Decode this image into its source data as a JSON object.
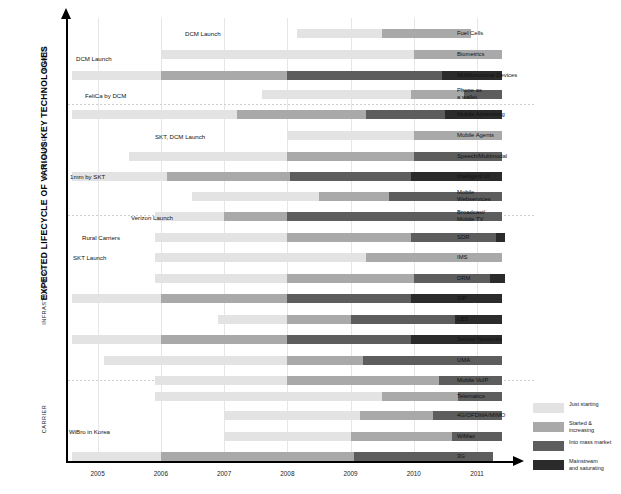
{
  "chart_data": {
    "type": "bar",
    "title": "EXPECTED LIFECYCLE OF VARIOUS KEY TECHNOLOGIES",
    "xlabel": "",
    "ylabel": "",
    "xlim": [
      2004.5,
      2011.6
    ],
    "grid": true,
    "legend_position": "bottom-right",
    "tick_labels": [
      "2005",
      "2006",
      "2007",
      "2008",
      "2009",
      "2010",
      "2011"
    ],
    "tick_values": [
      2005,
      2006,
      2007,
      2008,
      2009,
      2010,
      2011
    ],
    "stage_colors": [
      "#e3e3e3",
      "#a9a9a9",
      "#5d5d5d",
      "#2b2b2b"
    ],
    "legend": [
      {
        "label": "Just starting",
        "color": "#e3e3e3"
      },
      {
        "label": "Started &\nincreasing",
        "color": "#a9a9a9"
      },
      {
        "label": "Into mass market",
        "color": "#5d5d5d"
      },
      {
        "label": "Mainstream\nand saturating",
        "color": "#2b2b2b"
      }
    ],
    "groups": [
      {
        "name": "DEVICES",
        "top": 20,
        "bottom": 104
      },
      {
        "name": "MIDDLEWARE",
        "top": 104,
        "bottom": 215
      },
      {
        "name": "INFRASTRUCTURE",
        "top": 215,
        "bottom": 380
      },
      {
        "name": "CARRIER",
        "top": 380,
        "bottom": 461
      }
    ],
    "group_separators": [
      104,
      215,
      380
    ],
    "series": [
      {
        "name": "Fuel Cells",
        "y": 29,
        "segments": [
          {
            "stage": 0,
            "start": 2008.15,
            "end": 2009.5
          },
          {
            "stage": 1,
            "start": 2009.5,
            "end": 2010.9
          }
        ]
      },
      {
        "name": "Biometrics",
        "y": 50,
        "segments": [
          {
            "stage": 0,
            "start": 2006.0,
            "end": 2010.0
          },
          {
            "stage": 1,
            "start": 2010.0,
            "end": 2011.4
          }
        ]
      },
      {
        "name": "Multifunctional Devices",
        "y": 71,
        "segments": [
          {
            "stage": 0,
            "start": 2004.6,
            "end": 2006.0
          },
          {
            "stage": 1,
            "start": 2006.0,
            "end": 2008.0
          },
          {
            "stage": 2,
            "start": 2008.0,
            "end": 2010.45
          },
          {
            "stage": 3,
            "start": 2010.45,
            "end": 2011.4
          }
        ]
      },
      {
        "name": "Phone as\na wallet",
        "y": 90,
        "segments": [
          {
            "stage": 0,
            "start": 2007.6,
            "end": 2009.95
          },
          {
            "stage": 1,
            "start": 2009.95,
            "end": 2010.8
          },
          {
            "stage": 2,
            "start": 2010.8,
            "end": 2011.4
          }
        ]
      },
      {
        "name": "Mobile Advertising",
        "y": 110,
        "segments": [
          {
            "stage": 0,
            "start": 2004.6,
            "end": 2007.2
          },
          {
            "stage": 1,
            "start": 2007.2,
            "end": 2009.25
          },
          {
            "stage": 2,
            "start": 2009.25,
            "end": 2010.5
          },
          {
            "stage": 3,
            "start": 2010.5,
            "end": 2011.4
          }
        ]
      },
      {
        "name": "Mobile Agents",
        "y": 131,
        "segments": [
          {
            "stage": 0,
            "start": 2008.0,
            "end": 2010.0
          },
          {
            "stage": 1,
            "start": 2010.0,
            "end": 2011.4
          }
        ]
      },
      {
        "name": "Speech/Multimodal",
        "y": 152,
        "segments": [
          {
            "stage": 0,
            "start": 2005.5,
            "end": 2008.0
          },
          {
            "stage": 1,
            "start": 2008.0,
            "end": 2010.0
          },
          {
            "stage": 2,
            "start": 2010.0,
            "end": 2011.4
          }
        ]
      },
      {
        "name": "Intelligent UI",
        "y": 172,
        "segments": [
          {
            "stage": 0,
            "start": 2004.6,
            "end": 2006.1
          },
          {
            "stage": 1,
            "start": 2006.1,
            "end": 2008.05
          },
          {
            "stage": 2,
            "start": 2008.05,
            "end": 2009.95
          },
          {
            "stage": 3,
            "start": 2009.95,
            "end": 2011.4
          }
        ]
      },
      {
        "name": "Mobile\nWebservices",
        "y": 192,
        "segments": [
          {
            "stage": 0,
            "start": 2006.5,
            "end": 2008.5
          },
          {
            "stage": 1,
            "start": 2008.5,
            "end": 2009.6
          },
          {
            "stage": 2,
            "start": 2009.6,
            "end": 2011.4
          }
        ]
      },
      {
        "name": "Broadcast/\nMobile TV",
        "y": 212,
        "segments": [
          {
            "stage": 0,
            "start": 2005.9,
            "end": 2007.0
          },
          {
            "stage": 1,
            "start": 2007.0,
            "end": 2008.0
          },
          {
            "stage": 2,
            "start": 2008.0,
            "end": 2011.4
          }
        ]
      },
      {
        "name": "SDR",
        "y": 233,
        "segments": [
          {
            "stage": 0,
            "start": 2005.9,
            "end": 2008.0
          },
          {
            "stage": 1,
            "start": 2008.0,
            "end": 2009.95
          },
          {
            "stage": 2,
            "start": 2009.95,
            "end": 2011.3
          },
          {
            "stage": 3,
            "start": 2011.3,
            "end": 2011.45
          }
        ]
      },
      {
        "name": "IMS",
        "y": 253,
        "segments": [
          {
            "stage": 0,
            "start": 2005.9,
            "end": 2009.25
          },
          {
            "stage": 1,
            "start": 2009.25,
            "end": 2011.4
          }
        ]
      },
      {
        "name": "DRM",
        "y": 274,
        "segments": [
          {
            "stage": 0,
            "start": 2005.9,
            "end": 2008.0
          },
          {
            "stage": 1,
            "start": 2008.0,
            "end": 2010.0
          },
          {
            "stage": 2,
            "start": 2010.0,
            "end": 2011.2
          },
          {
            "stage": 3,
            "start": 2011.2,
            "end": 2011.45
          }
        ]
      },
      {
        "name": "SIP",
        "y": 294,
        "segments": [
          {
            "stage": 0,
            "start": 2004.6,
            "end": 2006.0
          },
          {
            "stage": 1,
            "start": 2006.0,
            "end": 2008.0
          },
          {
            "stage": 2,
            "start": 2008.0,
            "end": 2009.95
          },
          {
            "stage": 3,
            "start": 2009.95,
            "end": 2011.4
          }
        ]
      },
      {
        "name": "LBS",
        "y": 315,
        "segments": [
          {
            "stage": 0,
            "start": 2006.9,
            "end": 2008.0
          },
          {
            "stage": 1,
            "start": 2008.0,
            "end": 2009.0
          },
          {
            "stage": 2,
            "start": 2009.0,
            "end": 2010.65
          },
          {
            "stage": 3,
            "start": 2010.65,
            "end": 2011.4
          }
        ]
      },
      {
        "name": "Sensor Networks",
        "y": 335,
        "segments": [
          {
            "stage": 0,
            "start": 2004.6,
            "end": 2006.0
          },
          {
            "stage": 1,
            "start": 2006.0,
            "end": 2008.0
          },
          {
            "stage": 2,
            "start": 2008.0,
            "end": 2009.95
          },
          {
            "stage": 3,
            "start": 2009.95,
            "end": 2011.4
          }
        ]
      },
      {
        "name": "UMA",
        "y": 356,
        "segments": [
          {
            "stage": 0,
            "start": 2005.1,
            "end": 2008.0
          },
          {
            "stage": 1,
            "start": 2008.0,
            "end": 2009.2
          },
          {
            "stage": 2,
            "start": 2009.2,
            "end": 2011.4
          }
        ]
      },
      {
        "name": "Mobile VoIP",
        "y": 376,
        "segments": [
          {
            "stage": 0,
            "start": 2005.9,
            "end": 2008.0
          },
          {
            "stage": 1,
            "start": 2008.0,
            "end": 2010.4
          },
          {
            "stage": 2,
            "start": 2010.4,
            "end": 2011.4
          }
        ]
      },
      {
        "name": "Telematics",
        "y": 392,
        "segments": [
          {
            "stage": 0,
            "start": 2005.9,
            "end": 2009.5
          },
          {
            "stage": 1,
            "start": 2009.5,
            "end": 2010.7
          },
          {
            "stage": 2,
            "start": 2010.7,
            "end": 2011.4
          }
        ]
      },
      {
        "name": "4G/OFDMA/MIMO",
        "y": 411,
        "segments": [
          {
            "stage": 0,
            "start": 2007.0,
            "end": 2009.15
          },
          {
            "stage": 1,
            "start": 2009.15,
            "end": 2010.3
          },
          {
            "stage": 2,
            "start": 2010.3,
            "end": 2011.4
          }
        ]
      },
      {
        "name": "WiMax",
        "y": 432,
        "segments": [
          {
            "stage": 0,
            "start": 2007.0,
            "end": 2009.0
          },
          {
            "stage": 1,
            "start": 2009.0,
            "end": 2010.6
          },
          {
            "stage": 2,
            "start": 2010.6,
            "end": 2011.4
          }
        ]
      },
      {
        "name": "3G",
        "y": 452,
        "segments": [
          {
            "stage": 0,
            "start": 2004.6,
            "end": 2006.0
          },
          {
            "stage": 1,
            "start": 2006.0,
            "end": 2009.05
          },
          {
            "stage": 2,
            "start": 2009.05,
            "end": 2011.25
          }
        ]
      }
    ],
    "annotations": [
      {
        "text": "DCM Launch",
        "x": 185,
        "y": 30
      },
      {
        "text": "DCM Launch",
        "x": 76,
        "y": 55
      },
      {
        "text": "FeliCa by DCM",
        "x": 85,
        "y": 92
      },
      {
        "text": "SKT, DCM Launch",
        "x": 155,
        "y": 133
      },
      {
        "text": "1mm by SKT",
        "x": 70,
        "y": 173
      },
      {
        "text": "Verizon Launch",
        "x": 131,
        "y": 214
      },
      {
        "text": "Rural Carriers",
        "x": 82,
        "y": 234
      },
      {
        "text": "SKT Launch",
        "x": 73,
        "y": 254
      },
      {
        "text": "WiBro in Korea",
        "x": 69,
        "y": 428
      }
    ]
  }
}
